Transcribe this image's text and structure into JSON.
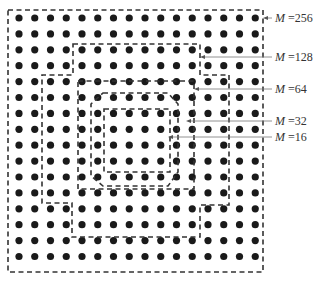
{
  "figure": {
    "grid": {
      "rows": 16,
      "cols": 16,
      "x0": 19,
      "y0": 18,
      "dx": 15.75,
      "dy": 15.9,
      "dot_radius": 3.6,
      "dot_color": "#1a1a1a"
    },
    "regions": [
      {
        "id": "m256",
        "label_var": "M",
        "label_value": "=256",
        "label_y": 18,
        "arrow_x": 263,
        "points": "8,10 263,10 263,272 8,272"
      },
      {
        "id": "m128",
        "label_var": "M",
        "label_value": "=128",
        "label_y": 57,
        "arrow_x": 200,
        "points": "73,44 200,44 200,75 229,75 229,205 200,205 200,237 72,237 72,203 42,203 42,75 73,75"
      },
      {
        "id": "m64",
        "label_var": "M",
        "label_value": "=64",
        "label_y": 89,
        "arrow_x": 194,
        "points": "78,81 194,81 194,189 78,189"
      },
      {
        "id": "m32",
        "label_var": "M",
        "label_value": "=32",
        "label_y": 121,
        "arrow_x": 186,
        "points": "103,93 168,93 178,104 178,172 168,186 103,186 91,176 91,104"
      },
      {
        "id": "m16",
        "label_var": "M",
        "label_value": "=16",
        "label_y": 137,
        "arrow_x": 168,
        "points": "104,109 170,109 170,172 104,172"
      }
    ],
    "label_x": 275,
    "line_color": "#333333",
    "caption": ""
  }
}
